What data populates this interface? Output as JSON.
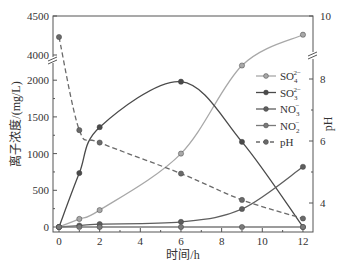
{
  "chart_data": {
    "type": "line",
    "title": "",
    "xlabel": "时间/h",
    "ylabel": "离子浓度/(mg/L)",
    "y2label": "pH",
    "x": [
      0,
      1,
      2,
      6,
      9,
      12
    ],
    "xlim": [
      -0.5,
      12.5
    ],
    "xticks": [
      "0",
      "2",
      "4",
      "6",
      "8",
      "10",
      "12"
    ],
    "ylim": [
      -50,
      4500
    ],
    "y_axis_break": [
      2200,
      4000
    ],
    "yticks_left": [
      "0",
      "500",
      "1000",
      "1500",
      "2000",
      "4000",
      "4500"
    ],
    "y2lim": [
      3.3,
      10
    ],
    "y2_axis_break": [
      8.5,
      9
    ],
    "yticks_right": [
      "4",
      "6",
      "8",
      "10"
    ],
    "grid": false,
    "legend_position": "center-right",
    "series": [
      {
        "name": "SO₄²⁻",
        "axis": "left",
        "style": "solid",
        "color": "#a8a8a8",
        "values": [
          0,
          110,
          230,
          1000,
          2200,
          4260
        ]
      },
      {
        "name": "SO₃²⁻",
        "axis": "left",
        "style": "solid",
        "color": "#4a4a4a",
        "values": [
          0,
          735,
          1360,
          1980,
          1160,
          0
        ]
      },
      {
        "name": "NO₃⁻",
        "axis": "left",
        "style": "solid",
        "color": "#5e5e5e",
        "values": [
          0,
          20,
          40,
          70,
          245,
          820
        ]
      },
      {
        "name": "NO₂⁻",
        "axis": "left",
        "style": "solid",
        "color": "#7a7a7a",
        "values": [
          0,
          0,
          0,
          0,
          0,
          0
        ]
      },
      {
        "name": "pH",
        "axis": "right",
        "style": "dashed",
        "color": "#6a6a6a",
        "values": [
          9.3,
          6.35,
          5.95,
          4.95,
          4.1,
          3.5
        ]
      }
    ]
  },
  "legend": {
    "items": [
      {
        "base": "SO",
        "sub": "4",
        "sup": "2−"
      },
      {
        "base": "SO",
        "sub": "3",
        "sup": "2−"
      },
      {
        "base": "NO",
        "sub": "3",
        "sup": "−"
      },
      {
        "base": "NO",
        "sub": "2",
        "sup": "−"
      },
      {
        "base": "pH",
        "sub": "",
        "sup": ""
      }
    ]
  }
}
